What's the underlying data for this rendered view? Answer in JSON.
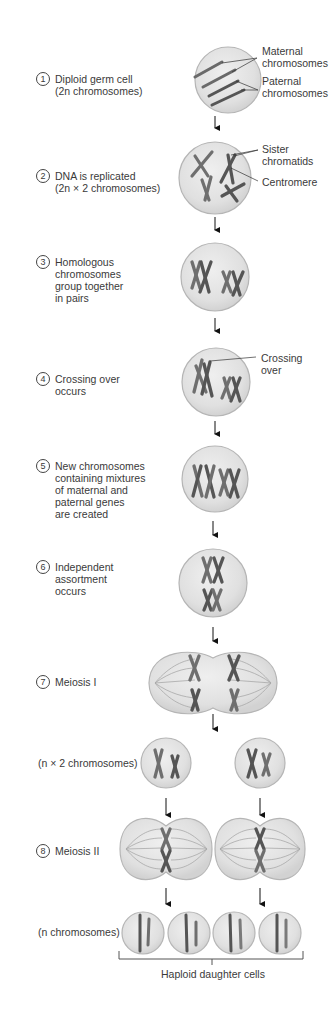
{
  "figure": {
    "title": "Meiosis",
    "steps": [
      {
        "number": "1",
        "text": "Diploid germ cell\n(2n chromosomes)"
      },
      {
        "number": "2",
        "text": "DNA is replicated\n(2n × 2 chromosomes)"
      },
      {
        "number": "3",
        "text": "Homologous\nchromosomes\ngroup together\nin pairs"
      },
      {
        "number": "4",
        "text": "Crossing over\noccurs"
      },
      {
        "number": "5",
        "text": "New chromosomes\ncontaining mixtures\nof maternal and\npaternal genes\nare created"
      },
      {
        "number": "6",
        "text": "Independent\nassortment\noccurs"
      },
      {
        "number": "7",
        "text": "Meiosis I"
      },
      {
        "number": "8",
        "text": "Meiosis II"
      }
    ],
    "callouts": {
      "maternal": "Maternal\nchromosomes",
      "paternal": "Paternal\nchromosomes",
      "sister": "Sister\nchromatids",
      "centromere": "Centromere",
      "crossing": "Crossing\nover"
    },
    "labels": {
      "n_x2": "(n × 2 chromosomes)",
      "n": "(n chromosomes)",
      "haploid": "Haploid daughter cells"
    },
    "colors": {
      "cell_fill": "#e4e4e4",
      "cell_edge": "#b8b8b8",
      "chromosome_dark": "#555555",
      "chromosome_light": "#8a8a8a",
      "text": "#3a3a3a"
    }
  }
}
